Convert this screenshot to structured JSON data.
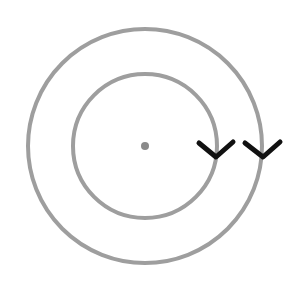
{
  "diagram": {
    "type": "concentric-circles",
    "center": {
      "x": 145,
      "y": 146
    },
    "circles": [
      {
        "name": "outer",
        "r": 117,
        "stroke": "#9e9e9e"
      },
      {
        "name": "inner",
        "r": 72,
        "stroke": "#9e9e9e"
      }
    ],
    "center_dot": {
      "r": 4,
      "fill": "#8a8a8a"
    },
    "arrows": [
      {
        "name": "inner-arrow",
        "apex": {
          "x": 216,
          "y": 157
        },
        "direction": "down",
        "color": "#111111"
      },
      {
        "name": "outer-arrow",
        "apex": {
          "x": 263,
          "y": 157
        },
        "direction": "down",
        "color": "#111111"
      }
    ]
  }
}
